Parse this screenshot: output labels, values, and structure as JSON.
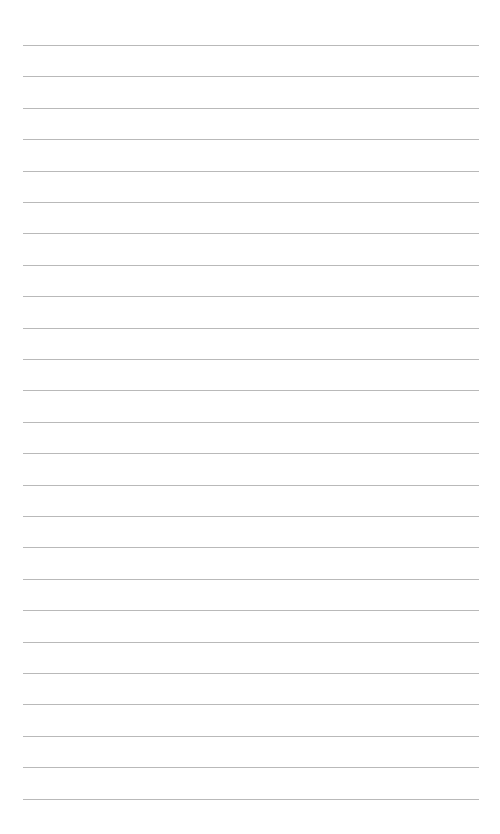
{
  "page": {
    "type": "lined-paper",
    "background_color": "#ffffff",
    "line_color": "#b9b9b9",
    "line_count": 25,
    "first_line_y": 45,
    "line_spacing": 31.4,
    "line_left_x": 23,
    "line_right_x": 479,
    "lines": []
  }
}
